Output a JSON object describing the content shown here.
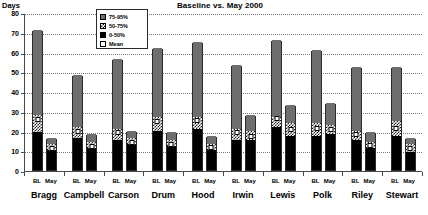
{
  "chart_data": {
    "type": "bar",
    "title": "Baseline vs. May 2000",
    "xlabel": "",
    "ylabel": "Days",
    "ylim": [
      0,
      80
    ],
    "yticks": [
      0,
      10,
      20,
      30,
      40,
      50,
      60,
      70,
      80
    ],
    "grid": true,
    "legend_position": "top-center",
    "stacked": true,
    "categories": [
      "Bragg",
      "Campbell",
      "Carson",
      "Drum",
      "Hood",
      "Irwin",
      "Lewis",
      "Polk",
      "Riley",
      "Stewart"
    ],
    "subcategories": [
      "BL",
      "May"
    ],
    "legend": [
      {
        "label": "75-95%",
        "fill": "gray",
        "color": "#6e6e6e"
      },
      {
        "label": "50-75%",
        "fill": "checkered",
        "color": "#1a1a1a"
      },
      {
        "label": "0-50%",
        "fill": "black",
        "color": "#000000"
      },
      {
        "label": "Mean",
        "fill": "white",
        "color": "#ffffff"
      }
    ],
    "series": [
      {
        "name": "BL",
        "points": [
          {
            "category": "Bragg",
            "total": 71,
            "p0_50": 19,
            "p50_75": 28,
            "p75_95": 71,
            "mean": 25.5
          },
          {
            "category": "Campbell",
            "total": 48,
            "p0_50": 16,
            "p50_75": 22,
            "p75_95": 48,
            "mean": 19.5
          },
          {
            "category": "Carson",
            "total": 56,
            "p0_50": 15,
            "p50_75": 21,
            "p75_95": 56,
            "mean": 19.0
          },
          {
            "category": "Drum",
            "total": 62,
            "p0_50": 20,
            "p50_75": 27,
            "p75_95": 62,
            "mean": 24.5
          },
          {
            "category": "Hood",
            "total": 65,
            "p0_50": 21,
            "p50_75": 27,
            "p75_95": 65,
            "mean": 25.0
          },
          {
            "category": "Irwin",
            "total": 53,
            "p0_50": 15,
            "p50_75": 21,
            "p75_95": 53,
            "mean": 19.0
          },
          {
            "category": "Lewis",
            "total": 66,
            "p0_50": 22,
            "p50_75": 27,
            "p75_95": 66,
            "mean": 26.0
          },
          {
            "category": "Polk",
            "total": 61,
            "p0_50": 17,
            "p50_75": 24,
            "p75_95": 61,
            "mean": 21.0
          },
          {
            "category": "Riley",
            "total": 52,
            "p0_50": 15,
            "p50_75": 20,
            "p75_95": 52,
            "mean": 18.0
          },
          {
            "category": "Stewart",
            "total": 52,
            "p0_50": 17,
            "p50_75": 25,
            "p75_95": 52,
            "mean": 21.0
          }
        ]
      },
      {
        "name": "May",
        "points": [
          {
            "category": "Bragg",
            "total": 16,
            "p0_50": 10,
            "p50_75": 13,
            "p75_95": 16,
            "mean": 11.0
          },
          {
            "category": "Campbell",
            "total": 18,
            "p0_50": 11,
            "p50_75": 14,
            "p75_95": 18,
            "mean": 12.0
          },
          {
            "category": "Carson",
            "total": 20,
            "p0_50": 13,
            "p50_75": 16,
            "p75_95": 20,
            "mean": 14.0
          },
          {
            "category": "Drum",
            "total": 19,
            "p0_50": 12,
            "p50_75": 15,
            "p75_95": 19,
            "mean": 13.0
          },
          {
            "category": "Hood",
            "total": 17,
            "p0_50": 10,
            "p50_75": 13,
            "p75_95": 17,
            "mean": 11.5
          },
          {
            "category": "Irwin",
            "total": 28,
            "p0_50": 15,
            "p50_75": 20,
            "p75_95": 28,
            "mean": 17.0
          },
          {
            "category": "Lewis",
            "total": 33,
            "p0_50": 17,
            "p50_75": 24,
            "p75_95": 33,
            "mean": 20.5
          },
          {
            "category": "Polk",
            "total": 34,
            "p0_50": 18,
            "p50_75": 23,
            "p75_95": 34,
            "mean": 20.5
          },
          {
            "category": "Riley",
            "total": 19,
            "p0_50": 11,
            "p50_75": 14,
            "p75_95": 19,
            "mean": 12.5
          },
          {
            "category": "Stewart",
            "total": 16,
            "p0_50": 9,
            "p50_75": 13,
            "p75_95": 16,
            "mean": 11.0
          }
        ]
      }
    ]
  }
}
